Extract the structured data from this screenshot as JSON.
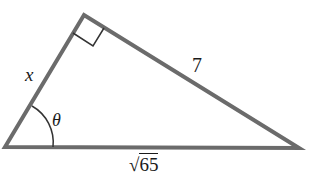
{
  "diagram": {
    "type": "right-triangle",
    "vertices": {
      "left": [
        5,
        147
      ],
      "top": [
        84,
        15
      ],
      "right": [
        299,
        148
      ]
    },
    "right_angle_at": "top",
    "stroke_color": "#6b6b6b",
    "labels": {
      "side_left": "x",
      "side_right": "7",
      "hypotenuse_radicand": "65",
      "hypotenuse_radical": "√",
      "angle": "θ"
    }
  }
}
